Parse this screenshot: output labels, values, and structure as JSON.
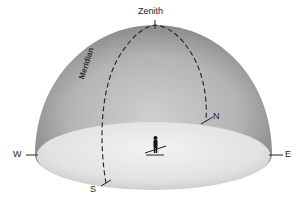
{
  "diagram": {
    "type": "celestial-sphere-horizon-dome",
    "labels": {
      "zenith": "Zenith",
      "meridian": "Meridian",
      "north": "N",
      "south": "S",
      "east": "E",
      "west": "W"
    },
    "elements": [
      "sky dome (hemisphere)",
      "horizon plane (ground ellipse)",
      "meridian (dashed great circle through zenith, N and S)",
      "observer figure at center"
    ],
    "colors": {
      "dome_edge": "#8a8a8a",
      "dome_center": "#c4c4c4",
      "ground": "#e4e4e4",
      "line": "#222222"
    }
  }
}
